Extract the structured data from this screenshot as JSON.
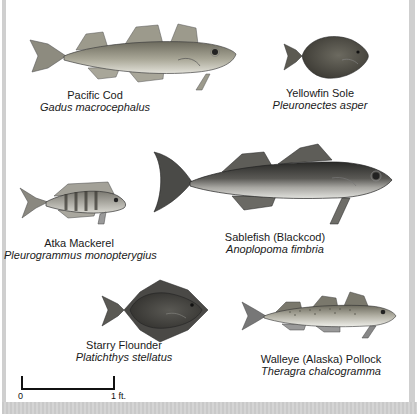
{
  "species": [
    {
      "common": "Pacific Cod",
      "scientific": "Gadus macrocephalus"
    },
    {
      "common": "Yellowfin Sole",
      "scientific": "Pleuronectes asper"
    },
    {
      "common": "Atka Mackerel",
      "scientific": "Pleurogrammus monopterygius"
    },
    {
      "common": "Sablefish (Blackcod)",
      "scientific": "Anoplopoma fimbria"
    },
    {
      "common": "Starry Flounder",
      "scientific": "Platichthys stellatus"
    },
    {
      "common": "Walleye (Alaska) Pollock",
      "scientific": "Theragra chalcogramma"
    }
  ],
  "scale_bar": {
    "start_label": "0",
    "end_label": "1 ft."
  },
  "colors": {
    "background": "#ffffff",
    "frame": "#cfcfcf",
    "text": "#1a1a1a"
  }
}
